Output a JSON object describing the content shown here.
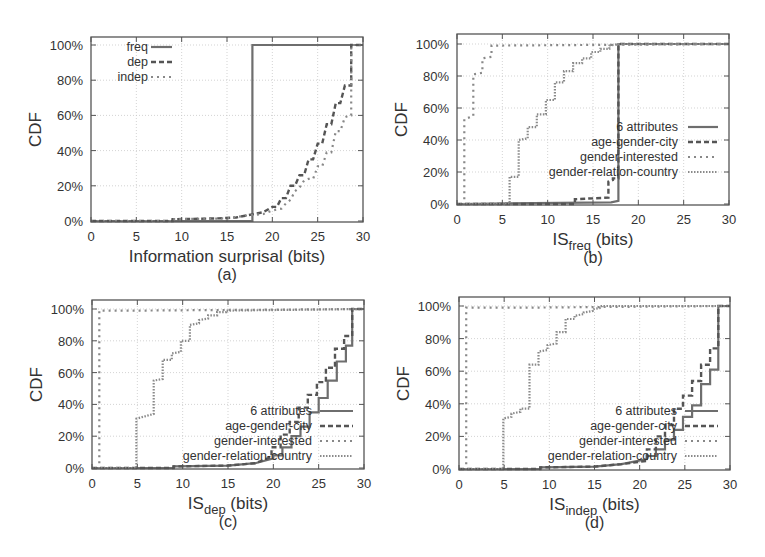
{
  "chart_data": [
    {
      "id": "a",
      "type": "line",
      "step": true,
      "caption": "(a)",
      "xlabel": "Information surprisal (bits)",
      "xlabel_sub": "",
      "xlabel_suffix": "",
      "ylabel": "CDF",
      "xlim": [
        0,
        30
      ],
      "ylim": [
        0,
        100
      ],
      "xticks": [
        0,
        5,
        10,
        15,
        20,
        25,
        30
      ],
      "yticks": [
        0,
        20,
        40,
        60,
        80,
        100
      ],
      "ytick_labels": [
        "0%",
        "20%",
        "40%",
        "60%",
        "80%",
        "100%"
      ],
      "grid": true,
      "legend_position": "top-left",
      "series": [
        {
          "name": "freq",
          "style": "solid",
          "x": [
            0,
            17.8,
            17.8,
            30
          ],
          "y": [
            0,
            0,
            100,
            100
          ]
        },
        {
          "name": "dep",
          "style": "dashed",
          "x": [
            0,
            9,
            9,
            14,
            16,
            17,
            18,
            19,
            20,
            20.5,
            21,
            21.5,
            22,
            22.5,
            23,
            23.5,
            24,
            24.5,
            25,
            25.5,
            26,
            26.5,
            27,
            27.5,
            28,
            28.5,
            28.7,
            28.7,
            30
          ],
          "y": [
            0,
            0,
            1,
            1.5,
            2,
            3,
            4,
            5,
            8,
            8,
            13,
            13,
            20,
            20,
            26,
            26,
            35,
            35,
            44,
            44,
            55,
            55,
            67,
            67,
            77,
            77,
            77,
            100,
            100
          ]
        },
        {
          "name": "indep",
          "style": "dotted",
          "x": [
            0,
            9,
            9,
            15,
            17,
            19,
            20,
            21,
            21.5,
            22,
            22.5,
            23,
            23.5,
            24,
            24.5,
            25,
            25.5,
            26,
            26.5,
            27,
            27.5,
            28,
            28.5,
            28.7,
            28.7,
            30
          ],
          "y": [
            0,
            0,
            1,
            1.5,
            3,
            4,
            6,
            7,
            10,
            12,
            17,
            19,
            23,
            24,
            24,
            31,
            31,
            39,
            39,
            51,
            51,
            59,
            60,
            60,
            100,
            100
          ]
        }
      ]
    },
    {
      "id": "b",
      "type": "line",
      "step": true,
      "caption": "(b)",
      "xlabel": "IS",
      "xlabel_sub": "freq",
      "xlabel_suffix": " (bits)",
      "ylabel": "CDF",
      "xlim": [
        0,
        30
      ],
      "ylim": [
        0,
        100
      ],
      "xticks": [
        0,
        5,
        10,
        15,
        20,
        25,
        30
      ],
      "yticks": [
        0,
        20,
        40,
        60,
        80,
        100
      ],
      "ytick_labels": [
        "0%",
        "20%",
        "40%",
        "60%",
        "80%",
        "100%"
      ],
      "grid": true,
      "legend_position": "center-right",
      "series": [
        {
          "name": "6 attributes",
          "style": "solid",
          "x": [
            0,
            17,
            17.8,
            17.8,
            30
          ],
          "y": [
            0,
            1,
            2,
            100,
            100
          ]
        },
        {
          "name": "age-gender-city",
          "style": "dashed",
          "x": [
            0,
            13,
            13,
            16.7,
            16.7,
            17.2,
            17.2,
            17.8,
            17.8,
            30
          ],
          "y": [
            0,
            0,
            3,
            4,
            14,
            15,
            16,
            16,
            100,
            100
          ]
        },
        {
          "name": "gender-interested",
          "style": "dotted",
          "x": [
            0,
            0.8,
            0.8,
            1.8,
            1.8,
            2.8,
            2.8,
            3.8,
            3.8,
            30
          ],
          "y": [
            0,
            0,
            53,
            55,
            81,
            82,
            91,
            92,
            99,
            100
          ]
        },
        {
          "name": "gender-relation-country",
          "style": "dense-dotted",
          "x": [
            0,
            5.8,
            5.8,
            6.8,
            6.8,
            7.8,
            7.8,
            8.8,
            8.8,
            9.8,
            9.8,
            10.8,
            10.8,
            11.8,
            11.8,
            12.8,
            12.8,
            13.8,
            13.8,
            14.8,
            14.8,
            15.8,
            15.8,
            16.8,
            16.8,
            17.8,
            30
          ],
          "y": [
            0,
            0,
            17,
            17,
            40,
            41,
            48,
            48,
            56,
            56,
            65,
            65,
            76,
            76,
            83,
            83,
            88,
            88,
            91,
            91,
            95,
            95,
            97,
            97,
            99,
            100,
            100
          ]
        }
      ]
    },
    {
      "id": "c",
      "type": "line",
      "step": true,
      "caption": "(c)",
      "xlabel": "IS",
      "xlabel_sub": "dep",
      "xlabel_suffix": " (bits)",
      "ylabel": "CDF",
      "xlim": [
        0,
        30
      ],
      "ylim": [
        0,
        100
      ],
      "xticks": [
        0,
        5,
        10,
        15,
        20,
        25,
        30
      ],
      "yticks": [
        0,
        20,
        40,
        60,
        80,
        100
      ],
      "ytick_labels": [
        "0%",
        "20%",
        "40%",
        "60%",
        "80%",
        "100%"
      ],
      "grid": true,
      "legend_position": "bottom-center",
      "series": [
        {
          "name": "6 attributes",
          "style": "solid",
          "x": [
            0,
            9,
            9,
            15,
            18,
            20,
            20,
            21,
            21,
            22,
            22,
            23,
            23,
            24,
            24,
            25,
            25,
            26,
            26,
            27,
            27,
            28,
            28,
            28.7,
            28.7,
            30
          ],
          "y": [
            0,
            0,
            1,
            1.5,
            3,
            6,
            8,
            8,
            13,
            13,
            20,
            20,
            26,
            26,
            35,
            35,
            44,
            44,
            55,
            55,
            67,
            67,
            77,
            77,
            100,
            100
          ]
        },
        {
          "name": "age-gender-city",
          "style": "dashed",
          "x": [
            0,
            9,
            9,
            15,
            18,
            19.8,
            19.8,
            20.8,
            20.8,
            21.8,
            21.8,
            22.8,
            22.8,
            23.8,
            23.8,
            24.8,
            24.8,
            25.8,
            25.8,
            26.8,
            26.8,
            27.8,
            27.8,
            28.7,
            28.7,
            30
          ],
          "y": [
            0,
            0,
            1,
            1.5,
            3,
            7,
            13,
            13,
            21,
            21,
            29,
            29,
            38,
            38,
            46,
            46,
            54,
            54,
            63,
            63,
            75,
            75,
            83,
            83,
            100,
            100
          ]
        },
        {
          "name": "gender-interested",
          "style": "dotted",
          "x": [
            0,
            0.8,
            0.8,
            5,
            30
          ],
          "y": [
            0,
            0,
            99,
            99,
            100
          ]
        },
        {
          "name": "gender-relation-country",
          "style": "dense-dotted",
          "x": [
            0,
            4.9,
            4.9,
            6.8,
            6.8,
            7.8,
            7.8,
            8.8,
            8.8,
            9.8,
            9.8,
            10.8,
            10.8,
            11.8,
            11.8,
            12.8,
            12.8,
            13.8,
            13.8,
            14.8,
            14.8,
            30
          ],
          "y": [
            0,
            0,
            31,
            34,
            55,
            56,
            68,
            68,
            72,
            73,
            80,
            80,
            90,
            91,
            93,
            94,
            96,
            96,
            98,
            98,
            99,
            100
          ]
        }
      ]
    },
    {
      "id": "d",
      "type": "line",
      "step": true,
      "caption": "(d)",
      "xlabel": "IS",
      "xlabel_sub": "indep",
      "xlabel_suffix": " (bits)",
      "ylabel": "CDF",
      "xlim": [
        0,
        30
      ],
      "ylim": [
        0,
        100
      ],
      "xticks": [
        0,
        5,
        10,
        15,
        20,
        25,
        30
      ],
      "yticks": [
        0,
        20,
        40,
        60,
        80,
        100
      ],
      "ytick_labels": [
        "0%",
        "20%",
        "40%",
        "60%",
        "80%",
        "100%"
      ],
      "grid": true,
      "legend_position": "bottom-center",
      "series": [
        {
          "name": "6 attributes",
          "style": "solid",
          "x": [
            0,
            9,
            9,
            15,
            18,
            20.8,
            20.8,
            21.8,
            21.8,
            22.8,
            22.8,
            23.8,
            23.8,
            24.8,
            24.8,
            25.8,
            25.8,
            26.8,
            26.8,
            27.8,
            27.8,
            28.7,
            28.7,
            30
          ],
          "y": [
            0,
            0,
            1,
            1.5,
            3,
            6,
            8,
            8,
            12,
            12,
            18,
            18,
            24,
            24,
            32,
            32,
            39,
            39,
            52,
            52,
            61,
            61,
            100,
            100
          ]
        },
        {
          "name": "age-gender-city",
          "style": "dashed",
          "x": [
            0,
            9,
            9,
            15,
            18,
            20.8,
            20.8,
            21.8,
            21.8,
            22.8,
            22.8,
            23.8,
            23.8,
            24.8,
            24.8,
            25.8,
            25.8,
            26.8,
            26.8,
            27.8,
            27.8,
            28.7,
            28.7,
            30
          ],
          "y": [
            0,
            0,
            1,
            1.5,
            3,
            5,
            12,
            12,
            20,
            20,
            27,
            27,
            37,
            37,
            45,
            45,
            54,
            54,
            64,
            64,
            74,
            74,
            100,
            100
          ]
        },
        {
          "name": "gender-interested",
          "style": "dotted",
          "x": [
            0,
            0.8,
            0.8,
            8,
            30
          ],
          "y": [
            0,
            0,
            99,
            99,
            100
          ]
        },
        {
          "name": "gender-relation-country",
          "style": "dense-dotted",
          "x": [
            0,
            4.9,
            4.9,
            5.8,
            5.8,
            6.8,
            6.8,
            7.8,
            7.8,
            8.8,
            8.8,
            9.8,
            9.8,
            10.8,
            10.8,
            11.8,
            11.8,
            12.8,
            12.8,
            13.8,
            13.8,
            14.8,
            14.8,
            15.8,
            15.8,
            30
          ],
          "y": [
            0,
            0,
            31,
            32,
            34,
            35,
            37,
            37,
            64,
            64,
            72,
            73,
            76,
            77,
            84,
            84,
            92,
            92,
            94,
            95,
            96,
            97,
            98,
            99,
            100,
            100
          ]
        }
      ]
    }
  ]
}
